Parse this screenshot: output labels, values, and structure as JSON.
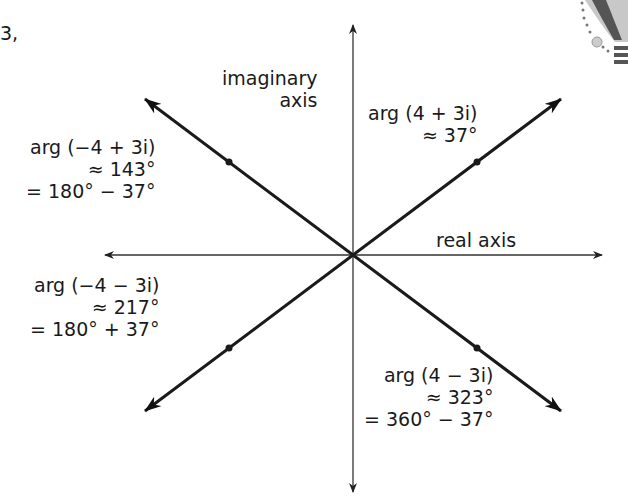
{
  "fragment_text": "3,",
  "axes": {
    "imaginary_label_line1": "imaginary",
    "imaginary_label_line2": "axis",
    "real_label": "real axis"
  },
  "vectors": [
    {
      "id": "q1",
      "number": "4 + 3i",
      "re": 4,
      "im": 3,
      "lines": [
        "arg (4 + 3i)",
        "≈ 37°"
      ]
    },
    {
      "id": "q2",
      "number": "-4 + 3i",
      "re": -4,
      "im": 3,
      "lines": [
        "arg (−4 + 3i)",
        "≈ 143°",
        "= 180° − 37°"
      ]
    },
    {
      "id": "q3",
      "number": "-4 - 3i",
      "re": -4,
      "im": -3,
      "lines": [
        "arg (−4 − 3i)",
        "≈ 217°",
        "= 180° + 37°"
      ]
    },
    {
      "id": "q4",
      "number": "4 - 3i",
      "re": 4,
      "im": -3,
      "lines": [
        "arg (4 − 3i)",
        "≈ 323°",
        "= 360° − 37°"
      ]
    }
  ],
  "colors": {
    "ink": "#1a1a1a",
    "axis": "#333333",
    "background": "#ffffff"
  }
}
